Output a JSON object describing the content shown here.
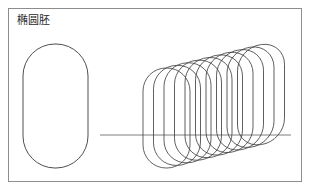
{
  "figure": {
    "label": "椭圆胚",
    "background_color": "#ffffff",
    "border_color": "#8d8d8d",
    "stroke_color": "#3a3a3a",
    "axis_color": "#6f6f6f",
    "frame": {
      "x": 8,
      "y": 8,
      "width": 294,
      "height": 174
    },
    "single_embryo": {
      "name": "elliptical-embryo-outline",
      "x": 23,
      "y": 44,
      "width": 65,
      "height": 124,
      "corner_radius": 32
    },
    "axis_line": {
      "name": "horizontal-axis-line",
      "x1": 100,
      "x2": 291,
      "y": 135
    },
    "stack": {
      "name": "embryo-rotation-stack",
      "count": 10,
      "base_x": 143,
      "base_y": 68,
      "width": 47,
      "height": 100,
      "corner_radius": 23,
      "step_x": 10.5,
      "step_y": -2.6,
      "skew_step": 0.9
    }
  }
}
